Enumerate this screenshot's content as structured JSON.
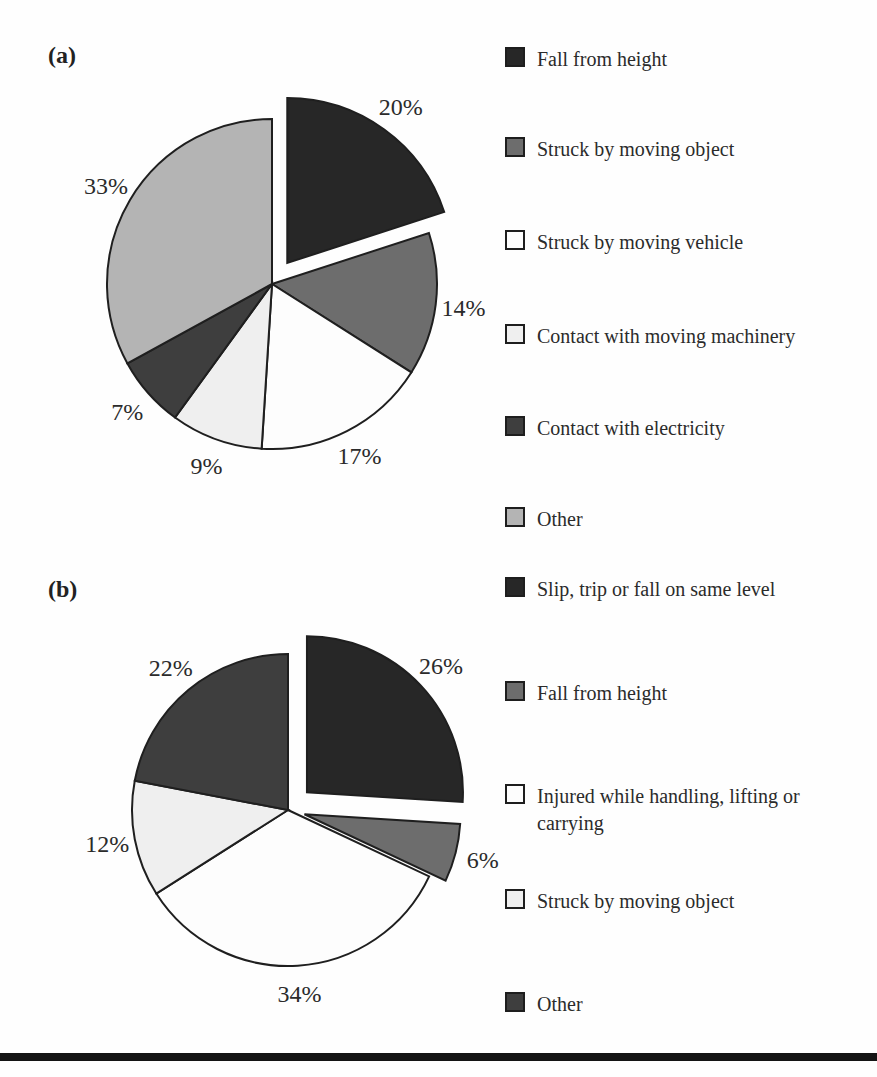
{
  "figure": {
    "panel_a_label": "(a)",
    "panel_b_label": "(b)",
    "bottom_rule_color": "#141414",
    "stroke_color": "#1f1f1f",
    "text_color": "#2b2b2b"
  },
  "chart_data": [
    {
      "type": "pie",
      "panel_label": "(a)",
      "legend_position": "right",
      "labels_shown_as": "percent",
      "start_angle_deg": 0,
      "direction": "clockwise",
      "slices": [
        {
          "label": "Fall from height",
          "value_pct": 20,
          "display": "20%",
          "color": "#272727",
          "exploded": true,
          "explode_px": 26
        },
        {
          "label": "Struck by moving object",
          "value_pct": 14,
          "display": "14%",
          "color": "#6d6d6d",
          "exploded": false,
          "explode_px": 0
        },
        {
          "label": "Struck by moving vehicle",
          "value_pct": 17,
          "display": "17%",
          "color": "#fdfdfd",
          "exploded": false,
          "explode_px": 0
        },
        {
          "label": "Contact with moving machinery",
          "value_pct": 9,
          "display": "9%",
          "color": "#efefef",
          "exploded": false,
          "explode_px": 0
        },
        {
          "label": "Contact with electricity",
          "value_pct": 7,
          "display": "7%",
          "color": "#3e3e3e",
          "exploded": false,
          "explode_px": 0
        },
        {
          "label": "Other",
          "value_pct": 33,
          "display": "33%",
          "color": "#b4b4b4",
          "exploded": false,
          "explode_px": 0
        }
      ]
    },
    {
      "type": "pie",
      "panel_label": "(b)",
      "legend_position": "right",
      "labels_shown_as": "percent",
      "start_angle_deg": 0,
      "direction": "clockwise",
      "slices": [
        {
          "label": "Slip, trip or fall on same level",
          "value_pct": 26,
          "display": "26%",
          "color": "#272727",
          "exploded": true,
          "explode_px": 26
        },
        {
          "label": "Fall from height",
          "value_pct": 6,
          "display": "6%",
          "color": "#6d6d6d",
          "exploded": true,
          "explode_px": 17
        },
        {
          "label": "Injured while handling, lifting or carrying",
          "value_pct": 34,
          "display": "34%",
          "color": "#fdfdfd",
          "exploded": false,
          "explode_px": 0
        },
        {
          "label": "Struck by moving object",
          "value_pct": 12,
          "display": "12%",
          "color": "#efefef",
          "exploded": false,
          "explode_px": 0
        },
        {
          "label": "Other",
          "value_pct": 22,
          "display": "22%",
          "color": "#3e3e3e",
          "exploded": false,
          "explode_px": 0
        }
      ]
    }
  ]
}
